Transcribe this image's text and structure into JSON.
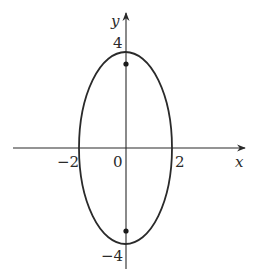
{
  "diagram": {
    "type": "ellipse-plot",
    "colors": {
      "stroke": "#2a2a2a",
      "background": "#ffffff"
    },
    "axes": {
      "x_label": "x",
      "y_label": "y",
      "origin_label": "0"
    },
    "tick_labels": {
      "x_neg": "−2",
      "x_pos": "2",
      "y_pos": "4",
      "y_neg": "−4"
    },
    "ellipse": {
      "center": [
        0,
        0
      ],
      "semi_axis_x": 2,
      "semi_axis_y": 4
    },
    "foci": [
      {
        "name": "upper-focus",
        "x": 0,
        "y": 3.46
      },
      {
        "name": "lower-focus",
        "x": 0,
        "y": -3.46
      }
    ]
  }
}
